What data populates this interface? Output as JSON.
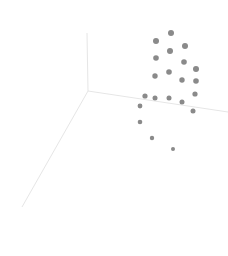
{
  "chart_data": {
    "type": "scatter",
    "subtype": "3d-scatter",
    "title": "",
    "xlabel": "",
    "ylabel": "",
    "zlabel": "",
    "grid": false,
    "legend": null,
    "colors": {
      "marker": "#8a8a8a",
      "axis": "#e6e6e6",
      "background": "#ffffff"
    },
    "axes_projected": {
      "origin": [
        88,
        91
      ],
      "vertical_end": [
        87,
        33
      ],
      "right_end": [
        228,
        112
      ],
      "down_left_end": [
        22,
        207
      ]
    },
    "points_projected": [
      {
        "x": 171,
        "y": 33,
        "r": 3.0
      },
      {
        "x": 156,
        "y": 41,
        "r": 3.0
      },
      {
        "x": 185,
        "y": 46,
        "r": 3.0
      },
      {
        "x": 170,
        "y": 51,
        "r": 3.0
      },
      {
        "x": 156,
        "y": 58,
        "r": 2.8
      },
      {
        "x": 184,
        "y": 62,
        "r": 2.8
      },
      {
        "x": 196,
        "y": 69,
        "r": 3.0
      },
      {
        "x": 169,
        "y": 72,
        "r": 2.8
      },
      {
        "x": 155,
        "y": 76,
        "r": 2.7
      },
      {
        "x": 182,
        "y": 80,
        "r": 2.7
      },
      {
        "x": 196,
        "y": 81,
        "r": 2.8
      },
      {
        "x": 195,
        "y": 94,
        "r": 2.6
      },
      {
        "x": 145,
        "y": 96,
        "r": 2.6
      },
      {
        "x": 155,
        "y": 98,
        "r": 2.5
      },
      {
        "x": 169,
        "y": 98,
        "r": 2.5
      },
      {
        "x": 182,
        "y": 102,
        "r": 2.5
      },
      {
        "x": 193,
        "y": 111,
        "r": 2.5
      },
      {
        "x": 140,
        "y": 106,
        "r": 2.4
      },
      {
        "x": 140,
        "y": 122,
        "r": 2.3
      },
      {
        "x": 152,
        "y": 138,
        "r": 2.2
      },
      {
        "x": 173,
        "y": 149,
        "r": 2.0
      }
    ]
  }
}
